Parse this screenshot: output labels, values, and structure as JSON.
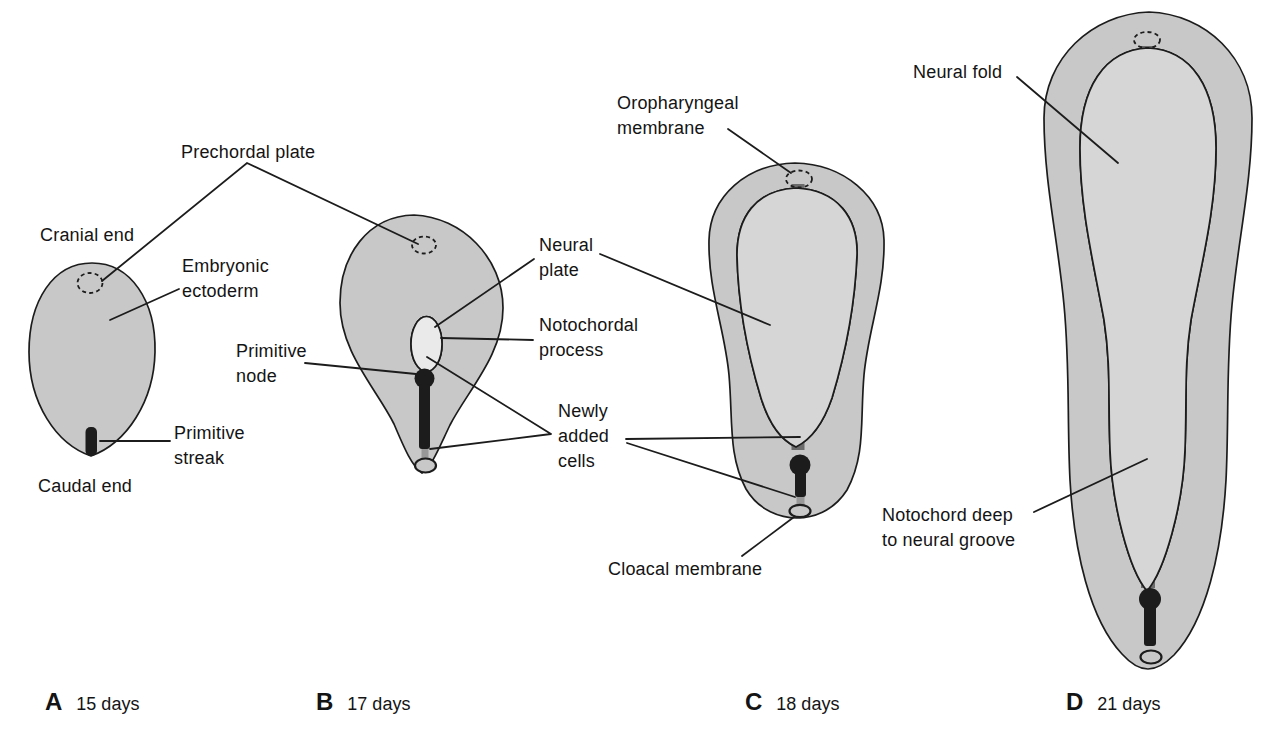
{
  "diagram": {
    "annotations": {
      "prechordal_plate": {
        "lines": [
          "Prechordal plate"
        ]
      },
      "cranial_end": {
        "lines": [
          "Cranial end"
        ]
      },
      "embryonic_ectoderm": {
        "lines": [
          "Embryonic",
          "ectoderm"
        ]
      },
      "primitive_node": {
        "lines": [
          "Primitive",
          "node"
        ]
      },
      "primitive_streak": {
        "lines": [
          "Primitive",
          "streak"
        ]
      },
      "caudal_end": {
        "lines": [
          "Caudal end"
        ]
      },
      "neural_plate": {
        "lines": [
          "Neural",
          "plate"
        ]
      },
      "notochordal_process": {
        "lines": [
          "Notochordal",
          "process"
        ]
      },
      "newly_added_cells": {
        "lines": [
          "Newly",
          "added",
          "cells"
        ]
      },
      "oropharyngeal_membrane": {
        "lines": [
          "Oropharyngeal",
          "membrane"
        ]
      },
      "cloacal_membrane": {
        "lines": [
          "Cloacal membrane"
        ]
      },
      "neural_fold": {
        "lines": [
          "Neural fold"
        ]
      },
      "notochord_deep": {
        "lines": [
          "Notochord deep",
          "to neural groove"
        ]
      }
    },
    "panels": [
      {
        "letter": "A",
        "age": "15 days"
      },
      {
        "letter": "B",
        "age": "17 days"
      },
      {
        "letter": "C",
        "age": "18 days"
      },
      {
        "letter": "D",
        "age": "21 days"
      }
    ],
    "colors": {
      "background": "#ffffff",
      "embryo_fill": "#c8c8c8",
      "inner_fill": "#d6d6d6",
      "b_inner_fill": "#eaeaea",
      "outline": "#1c1c1c",
      "stripe": "#6b6b6b",
      "dark": "#1c1c1c",
      "gray_tail": "#989898"
    }
  }
}
